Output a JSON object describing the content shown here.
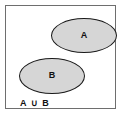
{
  "figure": {
    "universe_border_color": "#6e6e6e",
    "background_color": "#ffffff"
  },
  "sets": [
    {
      "id": "A",
      "label": "A",
      "fill_color": "#d6d6d6",
      "stroke_color": "#1a1a1a"
    },
    {
      "id": "B",
      "label": "B",
      "fill_color": "#d6d6d6",
      "stroke_color": "#1a1a1a"
    }
  ],
  "caption": {
    "text": "A ∪ B",
    "operator_symbol": "∪",
    "operator_name": "union"
  },
  "chart_data": {
    "type": "diagram",
    "diagram_kind": "venn",
    "title": "A ∪ B",
    "relationship": "disjoint",
    "sets": [
      "A",
      "B"
    ],
    "regions": [
      {
        "name": "A only",
        "shaded": true
      },
      {
        "name": "B only",
        "shaded": true
      },
      {
        "name": "A ∩ B",
        "shaded": false,
        "present": false
      },
      {
        "name": "universe outside A and B",
        "shaded": false
      }
    ]
  }
}
